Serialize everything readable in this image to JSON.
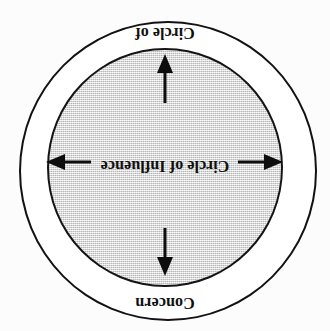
{
  "figure": {
    "orientation_degrees": 180,
    "background_color": "#fcfcfc",
    "outer_circle": {
      "label": "Circle of",
      "label_part_two": "Concern",
      "full_label": "Circle of Concern",
      "fill_color": "#ffffff",
      "stroke_color": "#121212"
    },
    "inner_circle": {
      "label": "Circle of Influence",
      "fill_color": "#d6d6d6",
      "stroke_color": "#141414"
    },
    "arrows": [
      {
        "name": "arrow-up",
        "direction": "up"
      },
      {
        "name": "arrow-right",
        "direction": "right"
      },
      {
        "name": "arrow-down",
        "direction": "down"
      },
      {
        "name": "arrow-left",
        "direction": "left"
      }
    ]
  }
}
